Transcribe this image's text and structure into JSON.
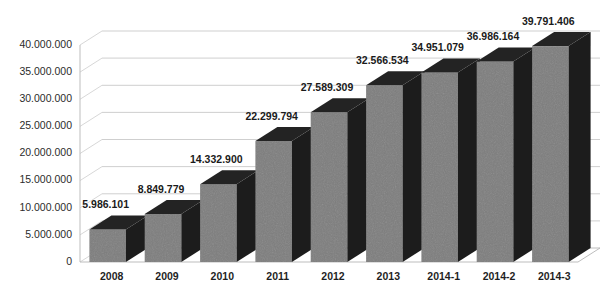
{
  "chart_data": {
    "type": "bar",
    "title": "",
    "subtitle": "",
    "xlabel": "",
    "ylabel": "",
    "categories": [
      "2008",
      "2009",
      "2010",
      "2011",
      "2012",
      "2013",
      "2014-1",
      "2014-2",
      "2014-3"
    ],
    "values": [
      5986101,
      8849779,
      14332900,
      22299794,
      27589309,
      32566534,
      34951079,
      36986164,
      39791406
    ],
    "value_labels": [
      "5.986.101",
      "8.849.779",
      "14.332.900",
      "22.299.794",
      "27.589.309",
      "32.566.534",
      "34.951.079",
      "36.986.164",
      "39.791.406"
    ],
    "ylim": [
      0,
      40000000
    ],
    "ytick_values": [
      0,
      5000000,
      10000000,
      15000000,
      20000000,
      25000000,
      30000000,
      35000000,
      40000000
    ],
    "ytick_labels": [
      "0",
      "5.000.000",
      "10.000.000",
      "15.000.000",
      "20.000.000",
      "25.000.000",
      "30.000.000",
      "35.000.000",
      "40.000.000"
    ],
    "grid": true,
    "legend": false,
    "legend_position": "none",
    "three_d": true,
    "series": [
      {
        "name": "",
        "values": [
          5986101,
          8849779,
          14332900,
          22299794,
          27589309,
          32566534,
          34951079,
          36986164,
          39791406
        ]
      }
    ],
    "colors": {
      "bar_front": "#7d7d7d",
      "bar_side": "#1c1c1c",
      "bar_top": "#232323",
      "gridline": "#c9c9c9",
      "background": "#ffffff",
      "text": "#1a1a1a"
    }
  }
}
